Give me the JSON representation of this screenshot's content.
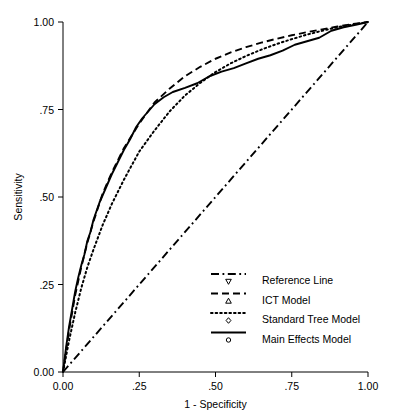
{
  "figure": {
    "cropped_top_caption": "▪▪▪▪▪▪▪▪▪▪▪▪▪▪▪ ▪▪▪ ▪▪▪▪▪▪▪▪▪ ▪▪▪▪"
  },
  "chart_data": {
    "type": "line",
    "title": "",
    "xlabel": "1 - Specificity",
    "ylabel": "Sensitivity",
    "xlim": [
      0,
      1
    ],
    "ylim": [
      0,
      1
    ],
    "grid": false,
    "legend_position": "lower-right-inside",
    "xticks": [
      0,
      0.25,
      0.5,
      0.75,
      1
    ],
    "xticklabels": [
      "0.00",
      ".25",
      ".50",
      ".75",
      "1.00"
    ],
    "yticks": [
      0,
      0.25,
      0.5,
      0.75,
      1
    ],
    "yticklabels": [
      "0.00",
      ".25",
      ".50",
      ".75",
      "1.00"
    ],
    "series": [
      {
        "name": "Reference Line",
        "linestyle": "dash-dot",
        "marker": "triangle-down",
        "color": "#000000",
        "x": [
          0.0,
          1.0
        ],
        "y": [
          0.0,
          1.0
        ]
      },
      {
        "name": "ICT Model",
        "linestyle": "dashed",
        "marker": "triangle-up",
        "color": "#000000",
        "x": [
          0.0,
          0.02,
          0.04,
          0.06,
          0.08,
          0.1,
          0.13,
          0.16,
          0.2,
          0.25,
          0.3,
          0.35,
          0.4,
          0.45,
          0.5,
          0.55,
          0.6,
          0.65,
          0.7,
          0.75,
          0.8,
          0.85,
          0.9,
          0.95,
          1.0
        ],
        "y": [
          0.0,
          0.12,
          0.22,
          0.3,
          0.37,
          0.43,
          0.51,
          0.57,
          0.64,
          0.71,
          0.77,
          0.81,
          0.845,
          0.872,
          0.895,
          0.913,
          0.928,
          0.941,
          0.952,
          0.962,
          0.971,
          0.979,
          0.987,
          0.994,
          1.0
        ]
      },
      {
        "name": "Standard Tree Model",
        "linestyle": "dotted",
        "marker": "diamond",
        "color": "#000000",
        "x": [
          0.0,
          0.02,
          0.04,
          0.06,
          0.08,
          0.1,
          0.13,
          0.16,
          0.2,
          0.25,
          0.3,
          0.35,
          0.4,
          0.45,
          0.5,
          0.55,
          0.6,
          0.65,
          0.7,
          0.75,
          0.8,
          0.85,
          0.9,
          0.95,
          1.0
        ],
        "y": [
          0.0,
          0.09,
          0.17,
          0.24,
          0.3,
          0.35,
          0.42,
          0.48,
          0.55,
          0.63,
          0.69,
          0.745,
          0.79,
          0.826,
          0.857,
          0.882,
          0.903,
          0.921,
          0.937,
          0.951,
          0.964,
          0.975,
          0.985,
          0.993,
          1.0
        ]
      },
      {
        "name": "Main Effects Model",
        "linestyle": "solid",
        "marker": "circle",
        "color": "#000000",
        "x": [
          0.0,
          0.01,
          0.02,
          0.03,
          0.04,
          0.05,
          0.06,
          0.07,
          0.08,
          0.09,
          0.1,
          0.12,
          0.14,
          0.16,
          0.18,
          0.2,
          0.22,
          0.24,
          0.26,
          0.28,
          0.3,
          0.33,
          0.36,
          0.4,
          0.44,
          0.48,
          0.52,
          0.56,
          0.6,
          0.64,
          0.68,
          0.72,
          0.76,
          0.8,
          0.84,
          0.88,
          0.92,
          0.96,
          1.0
        ],
        "y": [
          0.0,
          0.07,
          0.13,
          0.18,
          0.23,
          0.27,
          0.305,
          0.335,
          0.375,
          0.4,
          0.435,
          0.485,
          0.525,
          0.565,
          0.6,
          0.635,
          0.665,
          0.7,
          0.725,
          0.745,
          0.765,
          0.785,
          0.8,
          0.812,
          0.825,
          0.845,
          0.858,
          0.868,
          0.882,
          0.895,
          0.905,
          0.918,
          0.935,
          0.945,
          0.955,
          0.975,
          0.985,
          0.992,
          1.0
        ]
      }
    ],
    "legend_entries": [
      {
        "label": "Reference Line",
        "linestyle": "dash-dot",
        "marker": "triangle-down"
      },
      {
        "label": "ICT Model",
        "linestyle": "dashed",
        "marker": "triangle-up"
      },
      {
        "label": "Standard Tree Model",
        "linestyle": "dotted",
        "marker": "diamond"
      },
      {
        "label": "Main Effects Model",
        "linestyle": "solid",
        "marker": "circle"
      }
    ]
  }
}
